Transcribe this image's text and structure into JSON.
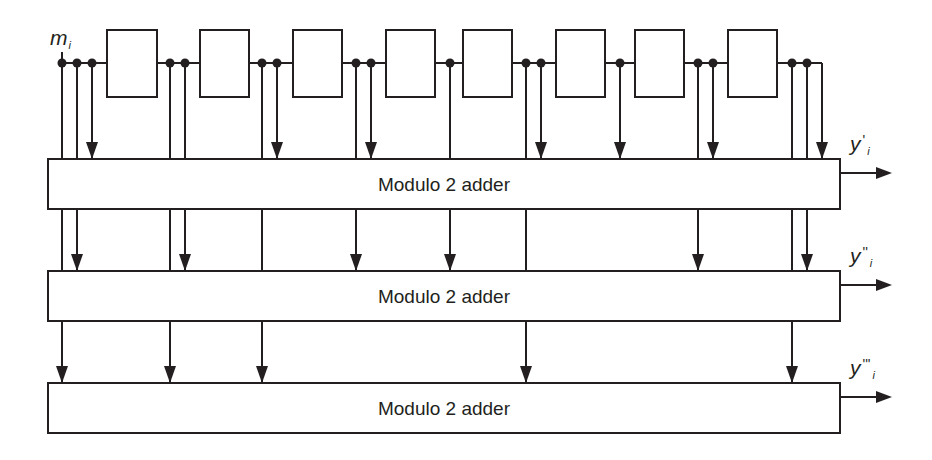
{
  "diagram": {
    "input": {
      "symbol": "m",
      "subscript": "i"
    },
    "register_line_y": 63,
    "register_stages": [
      {
        "x": 107,
        "w": 50
      },
      {
        "x": 200,
        "w": 49
      },
      {
        "x": 293,
        "w": 49
      },
      {
        "x": 386,
        "w": 49
      },
      {
        "x": 463,
        "w": 49
      },
      {
        "x": 556,
        "w": 49
      },
      {
        "x": 635,
        "w": 49
      },
      {
        "x": 728,
        "w": 49
      }
    ],
    "register_box": {
      "top": 30,
      "bottom": 97
    },
    "adders": [
      {
        "label": "Modulo 2 adder",
        "top": 159,
        "bottom": 209,
        "output": {
          "symbol": "y",
          "primes": "'",
          "subscript": "i"
        }
      },
      {
        "label": "Modulo 2 adder",
        "top": 271,
        "bottom": 321,
        "output": {
          "symbol": "y",
          "primes": "''",
          "subscript": "i"
        }
      },
      {
        "label": "Modulo 2 adder",
        "top": 383,
        "bottom": 433,
        "output": {
          "symbol": "y",
          "primes": "'''",
          "subscript": "i"
        }
      }
    ],
    "adder_x": {
      "left": 48,
      "right": 840
    },
    "taps": [
      {
        "x": 62,
        "dot": true,
        "ends_at_adder": 3
      },
      {
        "x": 77,
        "dot": true,
        "ends_at_adder": 2
      },
      {
        "x": 92,
        "dot": true,
        "ends_at_adder": 1
      },
      {
        "x": 170,
        "dot": true,
        "ends_at_adder": 3
      },
      {
        "x": 185,
        "dot": true,
        "ends_at_adder": 2
      },
      {
        "x": 262,
        "dot": true,
        "ends_at_adder": 3
      },
      {
        "x": 277,
        "dot": true,
        "ends_at_adder": 1
      },
      {
        "x": 356,
        "dot": true,
        "ends_at_adder": 2
      },
      {
        "x": 371,
        "dot": true,
        "ends_at_adder": 1
      },
      {
        "x": 450,
        "dot": true,
        "ends_at_adder": 2
      },
      {
        "x": 526,
        "dot": true,
        "ends_at_adder": 3
      },
      {
        "x": 541,
        "dot": true,
        "ends_at_adder": 1
      },
      {
        "x": 620,
        "dot": true,
        "ends_at_adder": 1
      },
      {
        "x": 698,
        "dot": true,
        "ends_at_adder": 2
      },
      {
        "x": 713,
        "dot": true,
        "ends_at_adder": 1
      },
      {
        "x": 792,
        "dot": true,
        "ends_at_adder": 3
      },
      {
        "x": 807,
        "dot": true,
        "ends_at_adder": 2
      },
      {
        "x": 822,
        "dot": false,
        "ends_at_adder": 1
      }
    ],
    "colors": {
      "line": "#231f20",
      "background": "#ffffff"
    }
  }
}
